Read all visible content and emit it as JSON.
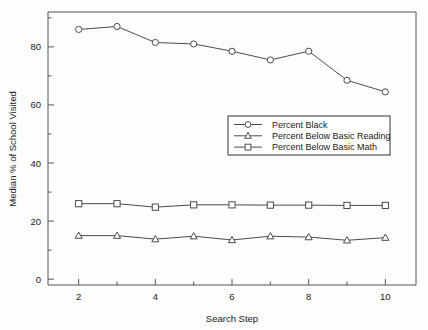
{
  "chart_data": {
    "type": "line",
    "title": "",
    "xlabel": "Search Step",
    "ylabel": "Median % of School Visited",
    "x": [
      2,
      3,
      4,
      5,
      6,
      7,
      8,
      9,
      10
    ],
    "xlim": [
      1.2,
      10.8
    ],
    "ylim": [
      -2,
      92
    ],
    "xticks": [
      2,
      4,
      6,
      8,
      10
    ],
    "xtick_labels": [
      "2",
      "4",
      "6",
      "8",
      "10"
    ],
    "xminor_ticks": [
      3,
      5,
      7,
      9
    ],
    "yticks": [
      0,
      20,
      40,
      60,
      80
    ],
    "ytick_labels": [
      "0",
      "20",
      "40",
      "60",
      "80"
    ],
    "yminor_ticks": [
      10,
      30,
      50,
      70,
      90
    ],
    "grid": false,
    "legend_position": "center-right",
    "series": [
      {
        "name": "Percent Black",
        "marker": "circle",
        "color": "#4a4a52",
        "values": [
          86.0,
          87.0,
          81.5,
          81.0,
          78.5,
          75.5,
          78.5,
          68.5,
          64.5
        ]
      },
      {
        "name": "Percent Below Basic Reading",
        "marker": "triangle",
        "color": "#4a4a52",
        "values": [
          15.0,
          15.0,
          13.8,
          14.8,
          13.5,
          14.8,
          14.5,
          13.4,
          14.3
        ]
      },
      {
        "name": "Percent Below Basic Math",
        "marker": "square",
        "color": "#4a4a52",
        "values": [
          26.0,
          26.0,
          24.8,
          25.6,
          25.6,
          25.5,
          25.5,
          25.4,
          25.4
        ]
      }
    ]
  },
  "legend": {
    "entries": [
      "Percent Black",
      "Percent Below Basic Reading",
      "Percent Below Basic Math"
    ]
  },
  "colors": {
    "line": "#4a4a52",
    "axis": "#555555",
    "background": "#fdfdfd",
    "marker_fill": "#ffffff"
  }
}
